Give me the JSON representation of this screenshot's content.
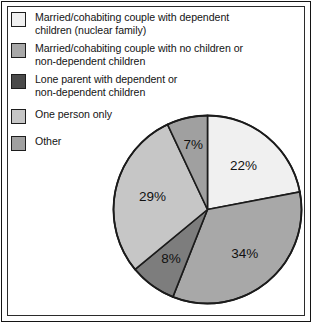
{
  "figure": {
    "background": "#ffffff",
    "border_color": "#141414"
  },
  "legend": {
    "items": [
      {
        "label": "Married/cohabiting couple with dependent\nchildren (nuclear family)",
        "swatch_name": "legend-swatch-nuclear-family",
        "color": "#f0f0f0"
      },
      {
        "label": "Married/cohabiting couple with no children or\nnon-dependent children",
        "swatch_name": "legend-swatch-couple-no-children",
        "color": "#a8a8a8"
      },
      {
        "label": "Lone parent with dependent or\nnon-dependent children",
        "swatch_name": "legend-swatch-lone-parent",
        "color": "#4a4a4a"
      },
      {
        "label": "One person only",
        "swatch_name": "legend-swatch-one-person",
        "color": "#c6c6c6"
      },
      {
        "label": "Other",
        "swatch_name": "legend-swatch-other",
        "color": "#a0a0a0"
      }
    ]
  },
  "chart_data": {
    "type": "pie",
    "title": "",
    "subtitle": "",
    "xlabel": "",
    "ylabel": "",
    "legend_position": "top-left",
    "grid": false,
    "start_angle_deg": 0,
    "direction": "clockwise",
    "center": {
      "x": 96.5,
      "y": 96.5
    },
    "radius": 94,
    "categories": [
      "Married/cohabiting couple with dependent children (nuclear family)",
      "Married/cohabiting couple with no children or non-dependent children",
      "Lone parent with dependent or non-dependent children",
      "One person only",
      "Other"
    ],
    "values": [
      22,
      34,
      8,
      29,
      7
    ],
    "value_labels": [
      "22%",
      "34%",
      "8%",
      "29%",
      "7%"
    ],
    "colors": [
      "#f0f0f0",
      "#a8a8a8",
      "#7d7d7d",
      "#c6c6c6",
      "#a0a0a0"
    ],
    "slice_border_color": "#1b1b1b",
    "label_color": "#111111",
    "label_radius_factor": [
      0.6,
      0.62,
      0.66,
      0.6,
      0.7
    ],
    "units": "percent",
    "total": 100
  }
}
